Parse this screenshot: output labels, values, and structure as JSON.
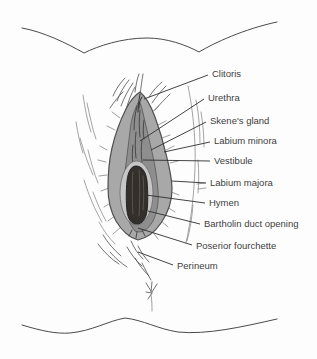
{
  "figure": {
    "background_color": "#fdfdfd",
    "colors": {
      "outline": "#4a4a4a",
      "leader_line": "#2e2e2e",
      "label_text": "#3d3d3d",
      "labia_majora_fill": "#a8a8a8",
      "labia_minora_fill": "#8e8e8e",
      "vestibule_rim_fill": "#c6c6c6",
      "opening_fill": "#332f2a"
    }
  },
  "annotations": [
    {
      "text": "Clitoris",
      "label": {
        "x": 212,
        "y": 74
      },
      "line": {
        "x1": 208,
        "y1": 75,
        "x2": 144,
        "y2": 99
      }
    },
    {
      "text": "Urethra",
      "label": {
        "x": 208,
        "y": 98
      },
      "line": {
        "x1": 204,
        "y1": 99,
        "x2": 140,
        "y2": 141
      }
    },
    {
      "text": "Skene's gland",
      "label": {
        "x": 210,
        "y": 121
      },
      "line": {
        "x1": 206,
        "y1": 122,
        "x2": 151,
        "y2": 150
      }
    },
    {
      "text": "Labium minora",
      "label": {
        "x": 214,
        "y": 141
      },
      "line": {
        "x1": 210,
        "y1": 142,
        "x2": 164,
        "y2": 152
      }
    },
    {
      "text": "Vestibule",
      "label": {
        "x": 214,
        "y": 161
      },
      "line": {
        "x1": 210,
        "y1": 161,
        "x2": 143,
        "y2": 160
      }
    },
    {
      "text": "Labium majora",
      "label": {
        "x": 210,
        "y": 183
      },
      "line": {
        "x1": 206,
        "y1": 183,
        "x2": 172,
        "y2": 181
      }
    },
    {
      "text": "Hymen",
      "label": {
        "x": 209,
        "y": 203
      },
      "line": {
        "x1": 205,
        "y1": 203,
        "x2": 146,
        "y2": 195
      }
    },
    {
      "text": "Bartholin duct opening",
      "label": {
        "x": 204,
        "y": 224
      },
      "line": {
        "x1": 200,
        "y1": 224,
        "x2": 148,
        "y2": 211
      }
    },
    {
      "text": "Poserior fourchette",
      "label": {
        "x": 196,
        "y": 246
      },
      "line": {
        "x1": 192,
        "y1": 245,
        "x2": 138,
        "y2": 228
      }
    },
    {
      "text": "Perineum",
      "label": {
        "x": 177,
        "y": 266
      },
      "line": {
        "x1": 173,
        "y1": 265,
        "x2": 138,
        "y2": 252
      }
    }
  ]
}
